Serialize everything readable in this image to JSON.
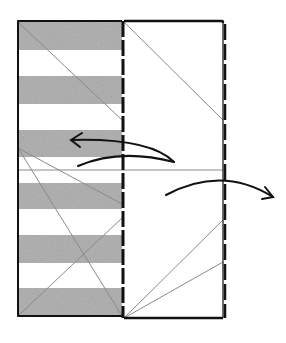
{
  "diagram": {
    "colors": {
      "outline": "#111111",
      "crease": "#8a8a8a",
      "stripe": "#b4b4b4",
      "background": "#ffffff"
    },
    "panels": [
      {
        "name": "striped-panel",
        "stripes": 6,
        "fill": "striped"
      },
      {
        "name": "blank-panel",
        "fill": "none"
      }
    ],
    "fold_line": {
      "style": "dashed",
      "position": "between panels"
    },
    "arrows": [
      {
        "name": "fold-left-arrow",
        "direction": "left"
      },
      {
        "name": "fold-right-arrow",
        "direction": "right"
      }
    ]
  }
}
